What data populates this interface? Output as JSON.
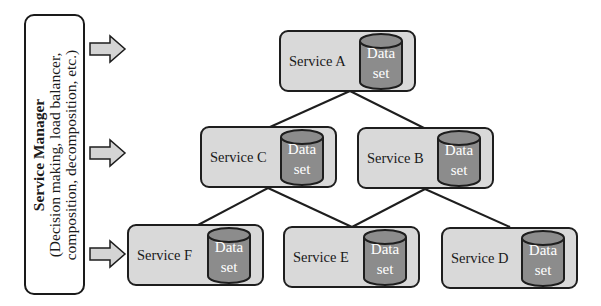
{
  "diagram": {
    "colors": {
      "service_fill": "#d9d9d9",
      "dataset_fill": "#8c8c8c",
      "outline": "#1e1e1e",
      "arrow_fill": "#d4d4d4",
      "dataset_text": "#ffffff"
    },
    "manager": {
      "title": "Service Manager",
      "subtitle_line1": "(Decision making, load balancer,",
      "subtitle_line2": "composition, decomposition, etc.)"
    },
    "arrows": [
      {
        "target_row": "top"
      },
      {
        "target_row": "middle"
      },
      {
        "target_row": "bottom"
      }
    ],
    "services": [
      {
        "id": "A",
        "label": "Service A",
        "dataset_line1": "Data",
        "dataset_line2": "set"
      },
      {
        "id": "C",
        "label": "Service C",
        "dataset_line1": "Data",
        "dataset_line2": "set"
      },
      {
        "id": "B",
        "label": "Service B",
        "dataset_line1": "Data",
        "dataset_line2": "set"
      },
      {
        "id": "F",
        "label": "Service F",
        "dataset_line1": "Data",
        "dataset_line2": "set"
      },
      {
        "id": "E",
        "label": "Service E",
        "dataset_line1": "Data",
        "dataset_line2": "set"
      },
      {
        "id": "D",
        "label": "Service D",
        "dataset_line1": "Data",
        "dataset_line2": "set"
      }
    ],
    "edges": [
      {
        "from": "Service A",
        "to": "Service C"
      },
      {
        "from": "Service A",
        "to": "Service B"
      },
      {
        "from": "Service C",
        "to": "Service F"
      },
      {
        "from": "Service C",
        "to": "Service E"
      },
      {
        "from": "Service B",
        "to": "Service E"
      },
      {
        "from": "Service B",
        "to": "Service D"
      }
    ]
  }
}
